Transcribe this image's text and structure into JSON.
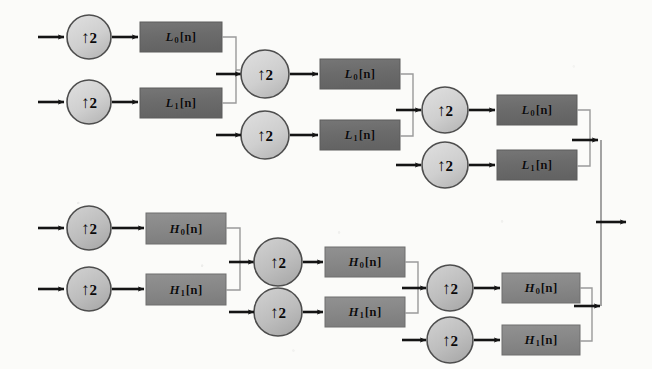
{
  "figure": {
    "kind": "signal-flow-diagram",
    "canvas": {
      "width": 652,
      "height": 369,
      "background": "#fbfbf9"
    }
  },
  "colors": {
    "filter_box_fill": "#6f6f6f",
    "filter_box_fill_light": "#8b8b8b",
    "filter_box_stroke": "#5a5a5a",
    "upsampler_fill": "#d2d2d2",
    "upsampler_fill_dark": "#b5b5b5",
    "upsampler_stroke": "#4a4a4a",
    "wire": "#1a1a1a",
    "thin_wire": "#8a8a8a",
    "text": "#0d0d0d"
  },
  "glyphs": {
    "up_arrow": "↑",
    "factor": "2",
    "bracket_open": "[",
    "bracket_close": "]",
    "index": "n"
  },
  "upsampler": {
    "label": "↑2",
    "arrow": "↑",
    "factor": "2",
    "meaning": "upsample by 2"
  },
  "branches": {
    "lowpass": {
      "name": "L",
      "stages": 3
    },
    "highpass": {
      "name": "H",
      "stages": 3
    }
  },
  "nodes": {
    "upsamplers": [
      {
        "id": "u-l-s1-0",
        "label": "↑2",
        "branch": "lowpass",
        "stage": 1,
        "cx": 89,
        "cy": 37,
        "rx": 22,
        "ry": 22
      },
      {
        "id": "u-l-s1-1",
        "label": "↑2",
        "branch": "lowpass",
        "stage": 1,
        "cx": 89,
        "cy": 102,
        "rx": 22,
        "ry": 22
      },
      {
        "id": "u-l-s2-0",
        "label": "↑2",
        "branch": "lowpass",
        "stage": 2,
        "cx": 265,
        "cy": 74,
        "rx": 24,
        "ry": 24
      },
      {
        "id": "u-l-s2-1",
        "label": "↑2",
        "branch": "lowpass",
        "stage": 2,
        "cx": 265,
        "cy": 135,
        "rx": 24,
        "ry": 24
      },
      {
        "id": "u-l-s3-0",
        "label": "↑2",
        "branch": "lowpass",
        "stage": 3,
        "cx": 445,
        "cy": 110,
        "rx": 23,
        "ry": 23
      },
      {
        "id": "u-l-s3-1",
        "label": "↑2",
        "branch": "lowpass",
        "stage": 3,
        "cx": 445,
        "cy": 165,
        "rx": 23,
        "ry": 23
      },
      {
        "id": "u-h-s1-0",
        "label": "↑2",
        "branch": "highpass",
        "stage": 1,
        "cx": 89,
        "cy": 228,
        "rx": 22,
        "ry": 22
      },
      {
        "id": "u-h-s1-1",
        "label": "↑2",
        "branch": "highpass",
        "stage": 1,
        "cx": 89,
        "cy": 289,
        "rx": 22,
        "ry": 22
      },
      {
        "id": "u-h-s2-0",
        "label": "↑2",
        "branch": "highpass",
        "stage": 2,
        "cx": 278,
        "cy": 262,
        "rx": 24,
        "ry": 24
      },
      {
        "id": "u-h-s2-1",
        "label": "↑2",
        "branch": "highpass",
        "stage": 2,
        "cx": 278,
        "cy": 312,
        "rx": 24,
        "ry": 24
      },
      {
        "id": "u-h-s3-0",
        "label": "↑2",
        "branch": "highpass",
        "stage": 3,
        "cx": 450,
        "cy": 288,
        "rx": 23,
        "ry": 23
      },
      {
        "id": "u-h-s3-1",
        "label": "↑2",
        "branch": "highpass",
        "stage": 3,
        "cx": 450,
        "cy": 340,
        "rx": 23,
        "ry": 23
      }
    ],
    "filters": [
      {
        "id": "f-l-s1-0",
        "base": "L",
        "sub": "0",
        "arg": "[n]",
        "label": "L0[n]",
        "branch": "lowpass",
        "stage": 1,
        "x": 140,
        "y": 22,
        "w": 82,
        "h": 30,
        "shade": "dark"
      },
      {
        "id": "f-l-s1-1",
        "base": "L",
        "sub": "1",
        "arg": "[n]",
        "label": "L1[n]",
        "branch": "lowpass",
        "stage": 1,
        "x": 140,
        "y": 88,
        "w": 82,
        "h": 30,
        "shade": "dark"
      },
      {
        "id": "f-l-s2-0",
        "base": "L",
        "sub": "0",
        "arg": "[n]",
        "label": "L0[n]",
        "branch": "lowpass",
        "stage": 2,
        "x": 320,
        "y": 59,
        "w": 80,
        "h": 30,
        "shade": "dark"
      },
      {
        "id": "f-l-s2-1",
        "base": "L",
        "sub": "1",
        "arg": "[n]",
        "label": "L1[n]",
        "branch": "lowpass",
        "stage": 2,
        "x": 320,
        "y": 120,
        "w": 80,
        "h": 30,
        "shade": "dark"
      },
      {
        "id": "f-l-s3-0",
        "base": "L",
        "sub": "0",
        "arg": "[n]",
        "label": "L0[n]",
        "branch": "lowpass",
        "stage": 3,
        "x": 497,
        "y": 95,
        "w": 80,
        "h": 30,
        "shade": "dark"
      },
      {
        "id": "f-l-s3-1",
        "base": "L",
        "sub": "1",
        "arg": "[n]",
        "label": "L1[n]",
        "branch": "lowpass",
        "stage": 3,
        "x": 497,
        "y": 150,
        "w": 80,
        "h": 30,
        "shade": "dark"
      },
      {
        "id": "f-h-s1-0",
        "base": "H",
        "sub": "0",
        "arg": "[n]",
        "label": "H0[n]",
        "branch": "highpass",
        "stage": 1,
        "x": 146,
        "y": 213,
        "w": 80,
        "h": 31,
        "shade": "mid"
      },
      {
        "id": "f-h-s1-1",
        "base": "H",
        "sub": "1",
        "arg": "[n]",
        "label": "H1[n]",
        "branch": "highpass",
        "stage": 1,
        "x": 146,
        "y": 274,
        "w": 80,
        "h": 31,
        "shade": "mid"
      },
      {
        "id": "f-h-s2-0",
        "base": "H",
        "sub": "0",
        "arg": "[n]",
        "label": "H0[n]",
        "branch": "highpass",
        "stage": 2,
        "x": 325,
        "y": 247,
        "w": 80,
        "h": 30,
        "shade": "mid"
      },
      {
        "id": "f-h-s2-1",
        "base": "H",
        "sub": "1",
        "arg": "[n]",
        "label": "H1[n]",
        "branch": "highpass",
        "stage": 2,
        "x": 325,
        "y": 297,
        "w": 80,
        "h": 30,
        "shade": "mid"
      },
      {
        "id": "f-h-s3-0",
        "base": "H",
        "sub": "0",
        "arg": "[n]",
        "label": "H0[n]",
        "branch": "highpass",
        "stage": 3,
        "x": 502,
        "y": 273,
        "w": 78,
        "h": 30,
        "shade": "mid"
      },
      {
        "id": "f-h-s3-1",
        "base": "H",
        "sub": "1",
        "arg": "[n]",
        "label": "H1[n]",
        "branch": "highpass",
        "stage": 3,
        "x": 502,
        "y": 325,
        "w": 78,
        "h": 30,
        "shade": "mid"
      }
    ],
    "inputs": [
      {
        "id": "in-l-0",
        "x": 38,
        "y": 37
      },
      {
        "id": "in-l-1",
        "x": 38,
        "y": 102
      },
      {
        "id": "in-h-0",
        "x": 38,
        "y": 228
      },
      {
        "id": "in-h-1",
        "x": 38,
        "y": 289
      }
    ],
    "output": {
      "id": "out-main",
      "x": 614,
      "y": 222
    }
  }
}
